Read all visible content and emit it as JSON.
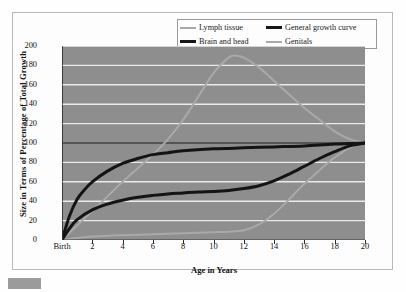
{
  "chart_data": {
    "type": "line",
    "title": "",
    "xlabel": "Age in Years",
    "ylabel": "Size in Terms of Percentage of Total Growth",
    "xlim": [
      0,
      20
    ],
    "ylim": [
      0,
      200
    ],
    "ytick_labels": [
      "0",
      "20",
      "40",
      "60",
      "80",
      "100",
      "120",
      "140",
      "160",
      "180",
      "200"
    ],
    "ytick_values": [
      0,
      20,
      40,
      60,
      80,
      100,
      120,
      140,
      160,
      180,
      200
    ],
    "xtick_labels": [
      "Birth",
      "2",
      "4",
      "6",
      "8",
      "10",
      "12",
      "14",
      "16",
      "18",
      "20"
    ],
    "xtick_values": [
      0,
      2,
      4,
      6,
      8,
      10,
      12,
      14,
      16,
      18,
      20
    ],
    "grid": true,
    "gridline_color": "#f0f0f0",
    "plot_background": "#8e8e8e",
    "reference_line": {
      "value": 100,
      "color": "#1c1c1c",
      "label": ""
    },
    "legend_position": "top-right",
    "series": [
      {
        "name": "Lymph tissue",
        "color": "#a9a9a9",
        "width": 2,
        "x": [
          0,
          1,
          2,
          3,
          4,
          5,
          6,
          7,
          8,
          9,
          10,
          11,
          11.5,
          12,
          13,
          14,
          15,
          16,
          17,
          18,
          19,
          20
        ],
        "values": [
          0,
          15,
          30,
          45,
          60,
          74,
          88,
          104,
          124,
          148,
          172,
          188,
          190,
          188,
          178,
          164,
          150,
          136,
          124,
          112,
          104,
          100
        ]
      },
      {
        "name": "Brain and head",
        "color": "#141414",
        "width": 3,
        "x": [
          0,
          0.5,
          1,
          1.5,
          2,
          3,
          4,
          5,
          6,
          7,
          8,
          10,
          12,
          14,
          16,
          18,
          20
        ],
        "values": [
          0,
          25,
          42,
          52,
          60,
          71,
          79,
          84,
          88,
          90,
          92,
          94,
          95,
          96,
          97,
          99,
          100
        ]
      },
      {
        "name": "General growth curve",
        "color": "#141414",
        "width": 3,
        "x": [
          0,
          0.5,
          1,
          2,
          3,
          4,
          5,
          6,
          7,
          8,
          9,
          10,
          11,
          12,
          13,
          14,
          15,
          16,
          17,
          18,
          19,
          20
        ],
        "values": [
          0,
          12,
          21,
          31,
          37,
          41,
          44,
          46,
          47.5,
          48.5,
          49.5,
          50,
          51,
          53,
          56,
          61,
          68,
          76,
          84,
          91,
          97,
          100
        ]
      },
      {
        "name": "Genitals",
        "color": "#a9a9a9",
        "width": 2,
        "x": [
          0,
          1,
          2,
          3,
          4,
          5,
          6,
          7,
          8,
          9,
          10,
          11,
          12,
          13,
          14,
          15,
          16,
          17,
          18,
          19,
          20
        ],
        "values": [
          0,
          2,
          3.5,
          4.5,
          5,
          5.5,
          6,
          6.5,
          7,
          7.5,
          8,
          8.5,
          10,
          16,
          27,
          42,
          58,
          72,
          85,
          95,
          100
        ]
      }
    ]
  },
  "legend": {
    "items": [
      {
        "label": "Lymph tissue",
        "swatch": "light"
      },
      {
        "label": "General growth curve",
        "swatch": "dark"
      },
      {
        "label": "Brain and head",
        "swatch": "dark"
      },
      {
        "label": "Genitals",
        "swatch": "light"
      }
    ]
  },
  "axes": {
    "x_title": "Age in Years",
    "y_title": "Size in Terms of Percentage of Total Growth"
  }
}
